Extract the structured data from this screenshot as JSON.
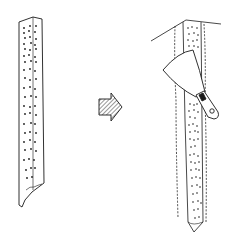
{
  "figure": {
    "type": "line-illustration",
    "panels": [
      {
        "name": "before",
        "description": "strip of textured wallpaper hanging, dotted pattern"
      },
      {
        "name": "arrow",
        "description": "hatched right-pointing arrow"
      },
      {
        "name": "after",
        "description": "strip being removed at ceiling corner with putty knife / scraper"
      }
    ]
  },
  "colors": {
    "ink": "#1a1a1a",
    "background": "#ffffff"
  }
}
